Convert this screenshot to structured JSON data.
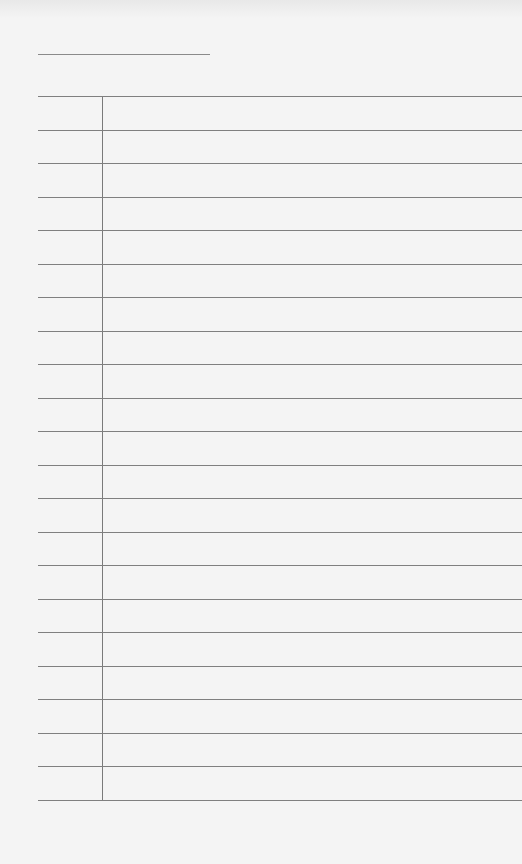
{
  "page": {
    "type": "blank ruled form",
    "title_field": "",
    "rows": 21,
    "colors": {
      "paper": "#f4f4f4",
      "rule": "#7f7f7f"
    }
  }
}
